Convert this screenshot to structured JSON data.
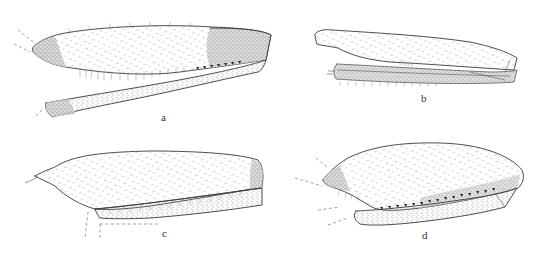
{
  "figure": {
    "panels": [
      {
        "id": "a",
        "label": "a"
      },
      {
        "id": "b",
        "label": "b"
      },
      {
        "id": "c",
        "label": "c"
      },
      {
        "id": "d",
        "label": "d"
      }
    ],
    "colors": {
      "background": "#ffffff",
      "ink": "#3a3a3a"
    }
  }
}
